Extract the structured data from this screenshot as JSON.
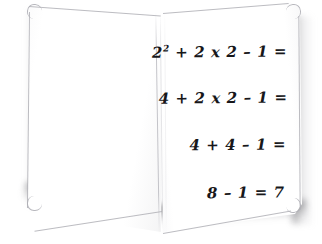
{
  "scene": {
    "subject": "open-notebook",
    "background_color": "#ffffff",
    "page_color": "#ffffff",
    "ink_color": "#17171a",
    "page_edge_color": "#b0b0b6",
    "shadow_color": "#55555a"
  },
  "notebook": {
    "left_page": {
      "label": "left page",
      "content": ""
    },
    "spine": {
      "label": "spine crease"
    },
    "right_page": {
      "label": "right page",
      "lines": [
        {
          "id": "step-1",
          "base": "2",
          "superscript": "2",
          "rest": " + 2 x 2 – 1 ="
        },
        {
          "id": "step-2",
          "text": "4 + 2 x 2 – 1 ="
        },
        {
          "id": "step-3",
          "text": "4 + 4 – 1 ="
        },
        {
          "id": "step-4",
          "text": "8 – 1 = 7"
        }
      ]
    }
  }
}
